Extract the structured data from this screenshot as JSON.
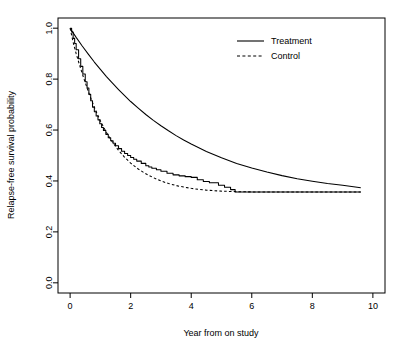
{
  "chart_data": {
    "type": "line",
    "title": "",
    "xlabel": "Year from on study",
    "ylabel": "Relapse-free survival probability",
    "xlim": [
      0,
      10
    ],
    "ylim": [
      0,
      1.0
    ],
    "xticks": [
      0,
      2,
      4,
      6,
      8,
      10
    ],
    "xtick_labels": [
      "0",
      "2",
      "4",
      "6",
      "8",
      "10"
    ],
    "yticks": [
      0.0,
      0.2,
      0.4,
      0.6,
      0.8,
      1.0
    ],
    "ytick_labels": [
      "0.0",
      "0.2",
      "0.4",
      "0.6",
      "0.8",
      "1.0"
    ],
    "grid": false,
    "legend_position": "top-right",
    "series": [
      {
        "name": "Treatment",
        "style": "solid",
        "color": "#000000",
        "x": [
          0.0,
          0.2,
          0.4,
          0.6,
          0.8,
          1.0,
          1.2,
          1.4,
          1.6,
          1.8,
          2.0,
          2.25,
          2.5,
          2.75,
          3.0,
          3.25,
          3.5,
          3.75,
          4.0,
          4.5,
          5.0,
          5.5,
          6.0,
          6.5,
          7.0,
          7.5,
          8.0,
          8.5,
          9.0,
          9.6
        ],
        "values": [
          1.0,
          0.964,
          0.93,
          0.898,
          0.867,
          0.838,
          0.81,
          0.784,
          0.759,
          0.735,
          0.712,
          0.686,
          0.661,
          0.638,
          0.617,
          0.597,
          0.578,
          0.561,
          0.545,
          0.516,
          0.491,
          0.469,
          0.451,
          0.435,
          0.421,
          0.409,
          0.399,
          0.39,
          0.383,
          0.373
        ]
      },
      {
        "name": "Control",
        "style": "dashed",
        "color": "#000000",
        "x": [
          0.0,
          0.1,
          0.2,
          0.3,
          0.4,
          0.5,
          0.6,
          0.7,
          0.8,
          0.9,
          1.0,
          1.2,
          1.4,
          1.6,
          1.8,
          2.0,
          2.25,
          2.5,
          2.75,
          3.0,
          3.25,
          3.5,
          3.75,
          4.0,
          4.25,
          4.5,
          4.75,
          5.0,
          5.25,
          5.5,
          6.0,
          6.5,
          7.0,
          7.5,
          8.0,
          8.5,
          9.0,
          9.6
        ],
        "values": [
          1.0,
          0.945,
          0.9,
          0.86,
          0.822,
          0.786,
          0.752,
          0.72,
          0.69,
          0.662,
          0.636,
          0.59,
          0.552,
          0.52,
          0.493,
          0.47,
          0.447,
          0.428,
          0.413,
          0.4,
          0.39,
          0.382,
          0.376,
          0.371,
          0.367,
          0.364,
          0.362,
          0.36,
          0.359,
          0.358,
          0.357,
          0.357,
          0.357,
          0.357,
          0.357,
          0.357,
          0.357,
          0.357
        ]
      },
      {
        "name": "Control observed (Kaplan-Meier step)",
        "style": "step",
        "color": "#000000",
        "x": [
          0.0,
          0.05,
          0.1,
          0.15,
          0.2,
          0.28,
          0.35,
          0.42,
          0.5,
          0.56,
          0.62,
          0.68,
          0.74,
          0.8,
          0.86,
          0.92,
          0.98,
          1.04,
          1.1,
          1.18,
          1.26,
          1.34,
          1.42,
          1.5,
          1.6,
          1.7,
          1.8,
          1.9,
          2.0,
          2.1,
          2.2,
          2.35,
          2.5,
          2.6,
          2.7,
          2.85,
          3.0,
          3.2,
          3.4,
          3.6,
          3.8,
          4.0,
          4.2,
          4.4,
          4.6,
          4.9,
          5.1,
          5.3,
          5.45,
          9.6
        ],
        "values": [
          1.0,
          0.985,
          0.96,
          0.94,
          0.915,
          0.88,
          0.85,
          0.82,
          0.79,
          0.765,
          0.74,
          0.715,
          0.69,
          0.672,
          0.655,
          0.64,
          0.625,
          0.61,
          0.598,
          0.583,
          0.57,
          0.558,
          0.548,
          0.538,
          0.527,
          0.517,
          0.508,
          0.5,
          0.492,
          0.485,
          0.478,
          0.469,
          0.46,
          0.455,
          0.45,
          0.444,
          0.438,
          0.43,
          0.424,
          0.42,
          0.417,
          0.414,
          0.405,
          0.398,
          0.393,
          0.383,
          0.375,
          0.366,
          0.357,
          0.357
        ]
      }
    ]
  },
  "legend": {
    "entries": [
      {
        "label": "Treatment",
        "style": "solid"
      },
      {
        "label": "Control",
        "style": "dashed"
      }
    ]
  },
  "colors": {
    "axis": "#000000",
    "curve": "#000000",
    "background": "#ffffff"
  }
}
